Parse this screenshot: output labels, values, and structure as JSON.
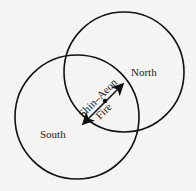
{
  "diagram": {
    "circles": [
      {
        "name": "North",
        "cx": 124,
        "cy": 72,
        "r": 60
      },
      {
        "name": "South",
        "cx": 77,
        "cy": 117,
        "r": 62
      }
    ],
    "labels": {
      "north": "North",
      "south": "South",
      "arrow_label_top": "Shin–Aeon",
      "arrow_label_bottom": "Fire"
    },
    "arrow": {
      "x1": 82,
      "y1": 125,
      "x2": 124,
      "y2": 83,
      "center": [
        105,
        101
      ]
    },
    "colors": {
      "stroke": "#111111",
      "background": "#f4f4f2"
    }
  }
}
